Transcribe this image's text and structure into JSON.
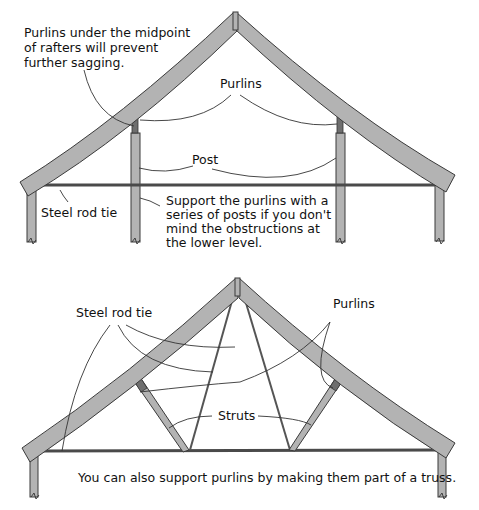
{
  "top_diagram": {
    "labels": {
      "purlins_note_line1": "Purlins under the midpoint",
      "purlins_note_line2": "of rafters will prevent",
      "purlins_note_line3": "further sagging.",
      "purlins": "Purlins",
      "post": "Post",
      "steel_rod_tie": "Steel rod tie",
      "support_note_line1": "Support the purlins with a",
      "support_note_line2": "series of posts if you don't",
      "support_note_line3": "mind the obstructions at",
      "support_note_line4": "the lower level."
    }
  },
  "bottom_diagram": {
    "labels": {
      "steel_rod_tie": "Steel rod tie",
      "purlins": "Purlins",
      "struts": "Struts",
      "caption": "You can also support purlins by making them part of a truss."
    }
  },
  "colors": {
    "member_fill": "#b3b3b3",
    "outline": "#3a3a3a",
    "background": "#ffffff"
  }
}
